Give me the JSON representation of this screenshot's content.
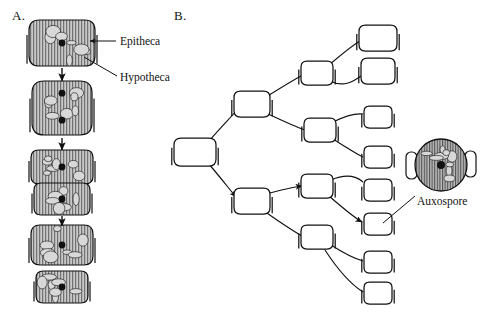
{
  "figure": {
    "type": "diagram",
    "background_color": "#ffffff",
    "ink_color": "#111111",
    "cytoplasm_fill": "#c9c9c9",
    "striation_color": "#555555"
  },
  "panels": [
    {
      "id": "A",
      "label": "A.",
      "label_x": 12,
      "label_y": 18,
      "description": "Vertical sequence of diatom cell division showing size reduction",
      "callouts": [
        {
          "name": "epitheca",
          "text": "Epitheca",
          "text_x": 120,
          "text_y": 44,
          "leader_from_x": 116,
          "leader_from_y": 41,
          "leader_to_x": 90,
          "leader_to_y": 41,
          "arrow": true
        },
        {
          "name": "hypotheca",
          "text": "Hypotheca",
          "text_x": 120,
          "text_y": 80,
          "leader_from_x": 117,
          "leader_from_y": 76,
          "leader_to_x": 84,
          "leader_to_y": 57,
          "arrow": false
        }
      ],
      "stages": [
        {
          "name": "stage-1-parent-cell",
          "cells": [
            {
              "cx": 62,
              "cy": 43,
              "rx": 33,
              "ry": 23,
              "shaded": true,
              "striated": true,
              "nucleus": true,
              "theca_bars": "both"
            }
          ]
        },
        {
          "name": "stage-2-nuclear-division",
          "cells": [
            {
              "cx": 62,
              "cy": 108,
              "rx": 30,
              "ry": 27,
              "shaded": true,
              "striated": true,
              "nucleus": true,
              "nucleus2": true,
              "theca_bars": "both"
            }
          ]
        },
        {
          "name": "stage-3-cytokinesis",
          "cells": [
            {
              "cx": 62,
              "cy": 167,
              "rx": 31,
              "ry": 17,
              "shaded": true,
              "striated": true,
              "nucleus": true,
              "theca_bars": "both"
            },
            {
              "cx": 62,
              "cy": 199,
              "rx": 28,
              "ry": 16,
              "shaded": true,
              "striated": true,
              "nucleus": true,
              "theca_bars": "both"
            }
          ]
        },
        {
          "name": "stage-4-daughter-cells",
          "cells": [
            {
              "cx": 62,
              "cy": 245,
              "rx": 31,
              "ry": 20,
              "shaded": true,
              "striated": true,
              "nucleus": true,
              "theca_bars": "both"
            },
            {
              "cx": 62,
              "cy": 287,
              "rx": 26,
              "ry": 16,
              "shaded": true,
              "striated": true,
              "nucleus": true,
              "theca_bars": "both"
            }
          ]
        }
      ],
      "arrows": [
        {
          "name": "division-arrow-1",
          "x1": 62,
          "y1": 68,
          "x2": 62,
          "y2": 81
        },
        {
          "name": "division-arrow-2",
          "x1": 62,
          "y1": 138,
          "x2": 62,
          "y2": 150
        },
        {
          "name": "division-arrow-3",
          "x1": 62,
          "y1": 216,
          "x2": 62,
          "y2": 226
        }
      ]
    },
    {
      "id": "B",
      "label": "B.",
      "label_x": 174,
      "label_y": 18,
      "description": "Branching lineage tree showing progressive diminution of cell size over successive divisions, culminating in auxospore formation",
      "callouts": [
        {
          "name": "auxospore",
          "text": "Auxospore",
          "text_x": 417,
          "text_y": 204,
          "leader_from_x": 415,
          "leader_from_y": 196,
          "leader_to_x": 383,
          "leader_to_y": 223,
          "arrow": false
        }
      ],
      "auxospore_cell": {
        "name": "auxospore-cell",
        "cx": 441,
        "cy": 165,
        "r": 26,
        "shaded": true,
        "striated": true,
        "nucleus": true,
        "side_thecae": true
      },
      "tree_cells": [
        {
          "name": "cell-gen0",
          "id": "g0",
          "cx": 195,
          "cy": 152,
          "rx": 21,
          "ry": 14
        },
        {
          "name": "cell-gen1-upper",
          "id": "g1a",
          "cx": 252,
          "cy": 104,
          "rx": 18,
          "ry": 13
        },
        {
          "name": "cell-gen1-lower",
          "id": "g1b",
          "cx": 252,
          "cy": 201,
          "rx": 18,
          "ry": 13
        },
        {
          "name": "cell-gen2-a",
          "id": "g2a",
          "cx": 317,
          "cy": 73,
          "rx": 16,
          "ry": 12
        },
        {
          "name": "cell-gen2-b",
          "id": "g2b",
          "cx": 320,
          "cy": 130,
          "rx": 16,
          "ry": 12
        },
        {
          "name": "cell-gen2-c",
          "id": "g2c",
          "cx": 317,
          "cy": 186,
          "rx": 16,
          "ry": 12
        },
        {
          "name": "cell-gen2-d",
          "id": "g2d",
          "cx": 317,
          "cy": 237,
          "rx": 16,
          "ry": 12
        },
        {
          "name": "cell-gen3-a",
          "id": "g3a",
          "cx": 378,
          "cy": 38,
          "rx": 19,
          "ry": 13
        },
        {
          "name": "cell-gen3-b",
          "id": "g3b",
          "cx": 378,
          "cy": 71,
          "rx": 17,
          "ry": 13
        },
        {
          "name": "cell-gen3-c",
          "id": "g3c",
          "cx": 378,
          "cy": 117,
          "rx": 14,
          "ry": 11
        },
        {
          "name": "cell-gen3-d",
          "id": "g3d",
          "cx": 378,
          "cy": 157,
          "rx": 14,
          "ry": 11
        },
        {
          "name": "cell-gen3-e",
          "id": "g3e",
          "cx": 378,
          "cy": 190,
          "rx": 14,
          "ry": 11
        },
        {
          "name": "cell-gen3-f",
          "id": "g3f",
          "cx": 378,
          "cy": 224,
          "rx": 14,
          "ry": 11
        },
        {
          "name": "cell-gen3-g",
          "id": "g3g",
          "cx": 378,
          "cy": 262,
          "rx": 14,
          "ry": 11
        },
        {
          "name": "cell-gen3-h",
          "id": "g3h",
          "cx": 378,
          "cy": 293,
          "rx": 14,
          "ry": 11
        }
      ],
      "tree_links": [
        {
          "name": "link-g0-g1a",
          "path": "M 209 141 C 222 126 232 116 237 110",
          "arrow": false
        },
        {
          "name": "link-g0-g1b",
          "path": "M 208 163 C 221 178 230 190 236 197",
          "arrow": true
        },
        {
          "name": "link-g1a-g2a",
          "path": "M 266 97 C 282 87 295 79 303 75",
          "arrow": false
        },
        {
          "name": "link-g1a-g2b",
          "path": "M 266 113 C 283 121 296 127 305 130",
          "arrow": false
        },
        {
          "name": "link-g1b-g2c",
          "path": "M 266 194 C 281 190 294 187 302 186",
          "arrow": true
        },
        {
          "name": "link-g1b-g2d",
          "path": "M 264 211 C 281 223 295 232 302 236",
          "arrow": false
        },
        {
          "name": "link-g2a-g3a",
          "path": "M 329 65 C 342 54 353 45 360 41",
          "arrow": false
        },
        {
          "name": "link-g2a-g3b",
          "path": "M 330 81 C 344 88 354 81 361 76",
          "arrow": false
        },
        {
          "name": "link-g2b-g3c",
          "path": "M 333 122 C 345 116 355 113 363 114",
          "arrow": false
        },
        {
          "name": "link-g2b-g3d",
          "path": "M 333 139 C 347 148 357 154 363 157",
          "arrow": false
        },
        {
          "name": "link-g2c-g3e",
          "path": "M 331 180 C 345 174 355 175 363 182",
          "arrow": false
        },
        {
          "name": "link-g2c-g3f",
          "path": "M 329 196 C 344 209 355 218 362 222",
          "arrow": true
        },
        {
          "name": "link-g2d-g3g",
          "path": "M 331 245 C 345 254 356 259 363 261",
          "arrow": false
        },
        {
          "name": "link-g2d-g3h",
          "path": "M 325 250 C 338 270 352 285 363 292",
          "arrow": false
        }
      ]
    }
  ]
}
